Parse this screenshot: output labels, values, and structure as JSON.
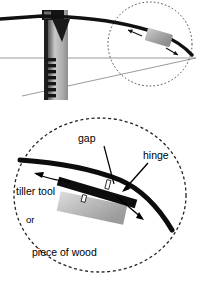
{
  "page": {
    "background_color": "#ffffff",
    "width": 200,
    "height": 284
  },
  "caption": {
    "text_fragment": "s for the bow."
  },
  "figure_top": {
    "name": "bow-on-tillering-tree",
    "parts": {
      "bow_limb": "bow-limb",
      "post": "tillering-tree-post",
      "notches": "tillering-notches",
      "cross_arm": "tillering-tree-cross-arm",
      "bow_string": "bow-string",
      "detail_circle": "detail-zoom-circle",
      "tool_block": "tiller-tool-block"
    },
    "colors": {
      "limb": "#111111",
      "post_light": "#bfbfbf",
      "post_dark": "#2b2b2b",
      "string": "#8a8a8a",
      "tool_block": "#a8a8a8",
      "circle_outline": "#333333"
    }
  },
  "figure_detail": {
    "name": "limb-hinge-detail",
    "circle_outline_color": "#222222",
    "labels": {
      "gap": "gap",
      "hinge": "hinge",
      "tiller_tool": "tiller tool",
      "or": "or",
      "piece_of_wood": "piece of wood"
    },
    "colors": {
      "limb": "#0d0d0d",
      "tiller_tool": "#0d0d0d",
      "wood_light": "#d4d4d4",
      "wood_dark": "#9a9a9a",
      "arrow": "#000000"
    }
  }
}
